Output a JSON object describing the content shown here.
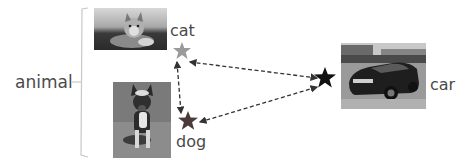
{
  "diagram": {
    "group_label": "animal",
    "items": [
      {
        "name": "cat",
        "label": "cat",
        "category": "animal",
        "star_color": "#9a9a9a"
      },
      {
        "name": "dog",
        "label": "dog",
        "category": "animal",
        "star_color": "#4a3a3a"
      },
      {
        "name": "car",
        "label": "car",
        "category": "",
        "star_color": "#111111"
      }
    ],
    "edges": [
      {
        "from": "cat",
        "to": "car",
        "style": "dashed",
        "direction": "both"
      },
      {
        "from": "cat",
        "to": "dog",
        "style": "dashed",
        "direction": "both"
      },
      {
        "from": "dog",
        "to": "car",
        "style": "dashed",
        "direction": "both"
      }
    ],
    "colors": {
      "bracket": "#c8c8c8",
      "arrow": "#333333",
      "text": "#4a4a4a"
    }
  }
}
